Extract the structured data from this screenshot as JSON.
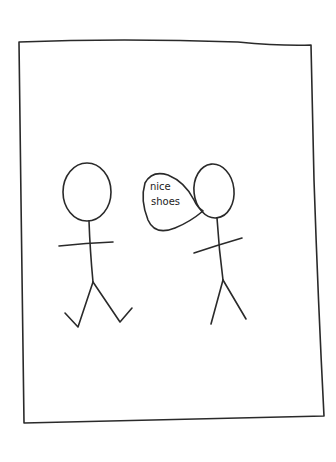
{
  "drawing": {
    "style": "hand-drawn stick figure sketch",
    "ink_color": "#2a2a2a",
    "background": "#ffffff",
    "speech_bubble": {
      "line1": "nice",
      "line2": "shoes"
    }
  }
}
